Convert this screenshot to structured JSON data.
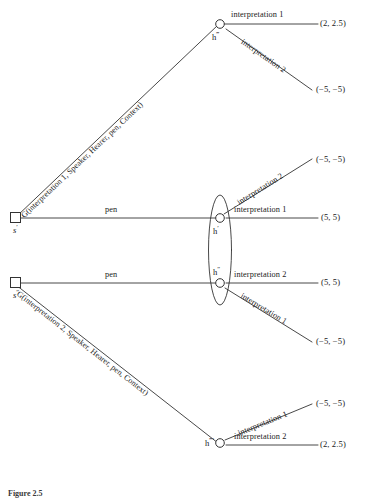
{
  "figure": {
    "caption": "Figure 2.5"
  },
  "nodes": {
    "sender_top": {
      "id": "s-prime",
      "base": "s",
      "primes": "′",
      "shape": "square"
    },
    "sender_bottom": {
      "id": "s-double-prime",
      "base": "s",
      "primes": "″",
      "shape": "square"
    },
    "hearer_top": {
      "id": "h-triple-prime",
      "base": "h",
      "primes": "‴",
      "shape": "circle"
    },
    "hearer_mid_upper": {
      "id": "h-prime",
      "base": "h",
      "primes": "′",
      "shape": "circle"
    },
    "hearer_mid_lower": {
      "id": "h-double-prime",
      "base": "h",
      "primes": "″",
      "shape": "circle"
    },
    "hearer_bottom": {
      "id": "h-quadruple-prime",
      "base": "h",
      "primes": "‴′",
      "shape": "circle"
    }
  },
  "branches": {
    "sender_top_diagonal": "G(interpretation 1, Speaker, Hearer, pen, Context)",
    "sender_top_horizontal": "pen",
    "sender_bottom_horizontal": "pen",
    "sender_bottom_diagonal": "G(interpretation 2, Speaker, Hearer, pen, Context)",
    "h3_upper": "interpretation 1",
    "h3_lower": "interpretation 2",
    "h1_upper": "interpretation 2",
    "h1_lower": "interpretation 1",
    "h2_upper": "interpretation 2",
    "h2_lower": "interpretation 1",
    "h4_upper": "interpretation 1",
    "h4_lower": "interpretation 2"
  },
  "payoffs": {
    "p1": "(2, 2.5)",
    "p2": "(−5, −5)",
    "p3": "(−5, −5)",
    "p4": "(5, 5)",
    "p5": "(5, 5)",
    "p6": "(−5, −5)",
    "p7": "(−5, −5)",
    "p8": "(2, 2.5)"
  },
  "info_set": {
    "name": "information-set-oval",
    "members": [
      "h′",
      "h″"
    ]
  },
  "colors": {
    "line": "#333333",
    "text": "#1a1a1a",
    "background": "#ffffff"
  }
}
